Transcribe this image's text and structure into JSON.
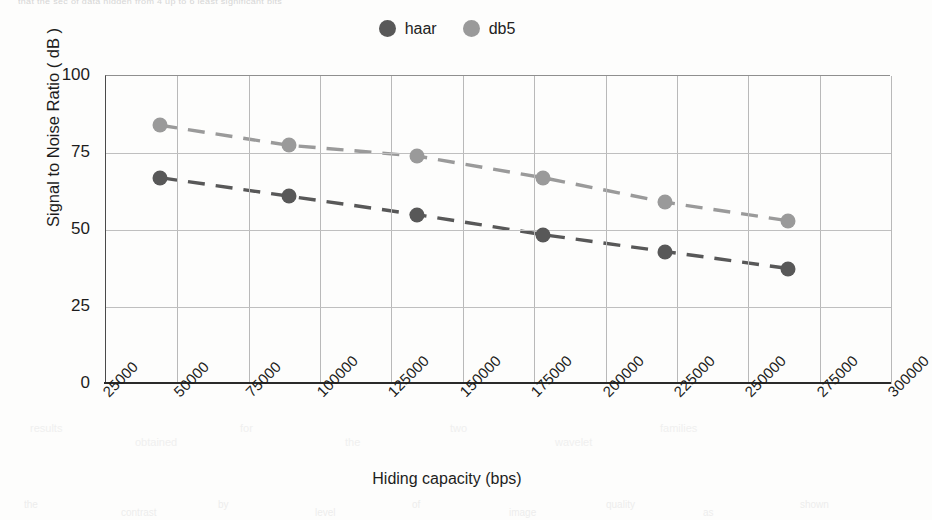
{
  "bleed": {
    "top_text": "that the sec of data hidden from 4 up to 6 least significant bits",
    "bottom_fragments": [
      "the",
      "contrast",
      "by",
      "level",
      "of",
      "image",
      "quality",
      "as",
      "shown"
    ],
    "mid_fragments": [
      "results",
      "obtained",
      "for",
      "the",
      "two",
      "wavelet",
      "families"
    ]
  },
  "legend": {
    "position": "top-center",
    "items": [
      {
        "label": "haar",
        "color": "#585858",
        "marker": "filled-circle"
      },
      {
        "label": "db5",
        "color": "#9a9a9a",
        "marker": "filled-circle"
      }
    ]
  },
  "axes": {
    "x_title": "Hiding capacity (bps)",
    "y_title": "Signal to Noise Ratio ( dB )",
    "x_ticks": [
      "25000",
      "50000",
      "75000",
      "100000",
      "125000",
      "150000",
      "175000",
      "200000",
      "225000",
      "250000",
      "275000",
      "300000"
    ],
    "y_ticks": [
      "0",
      "25",
      "50",
      "75",
      "100"
    ]
  },
  "chart_data": {
    "type": "scatter",
    "title": "",
    "xlabel": "Hiding capacity (bps)",
    "ylabel": "Signal to Noise Ratio ( dB )",
    "xlim": [
      25000,
      300000
    ],
    "ylim": [
      0,
      100
    ],
    "xticks": [
      25000,
      50000,
      75000,
      100000,
      125000,
      150000,
      175000,
      200000,
      225000,
      250000,
      275000,
      300000
    ],
    "yticks": [
      0,
      25,
      50,
      75,
      100
    ],
    "grid": true,
    "legend_position": "top-center",
    "trendline": "dashed",
    "series": [
      {
        "name": "haar",
        "color": "#585858",
        "x": [
          44000,
          89000,
          134000,
          178000,
          221000,
          264000
        ],
        "values": [
          67,
          61,
          55,
          48.5,
          43,
          37.5
        ]
      },
      {
        "name": "db5",
        "color": "#9a9a9a",
        "x": [
          44000,
          89000,
          134000,
          178000,
          221000,
          264000
        ],
        "values": [
          84,
          77.5,
          74,
          67,
          59,
          53
        ]
      }
    ]
  }
}
